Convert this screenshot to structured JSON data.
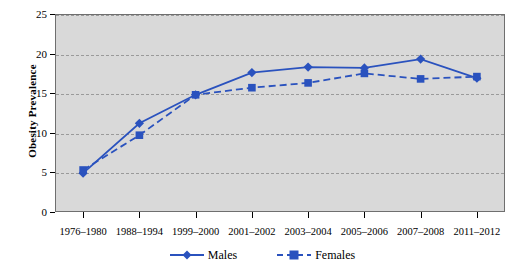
{
  "chart_data": {
    "type": "line",
    "title": "",
    "xlabel": "",
    "ylabel": "Obesity  Prevalence",
    "ylim": [
      0,
      25
    ],
    "ytick_labels": [
      "0",
      "5",
      "10",
      "15",
      "20",
      "25"
    ],
    "ytick_values": [
      0,
      5,
      10,
      15,
      20,
      25
    ],
    "grid": true,
    "legend_position": "bottom-center",
    "categories": [
      "1976–1980",
      "1988–1994",
      "1999–2000",
      "2001–2002",
      "2003–2004",
      "2005–2006",
      "2007–2008",
      "2011–2012"
    ],
    "series": [
      {
        "name": "Males",
        "color": "#2a52be",
        "line_style": "solid",
        "marker": "diamond",
        "values": [
          4.9,
          11.2,
          14.8,
          17.6,
          18.3,
          18.2,
          19.3,
          16.9
        ]
      },
      {
        "name": "Females",
        "color": "#2a52be",
        "line_style": "dashed",
        "marker": "square",
        "values": [
          5.3,
          9.7,
          14.8,
          15.7,
          16.3,
          17.5,
          16.8,
          17.1
        ]
      }
    ]
  },
  "legend": {
    "items": [
      {
        "label": "Males"
      },
      {
        "label": "Females"
      }
    ]
  },
  "colors": {
    "series": "#2a52be",
    "plot_background": "#d9d9d9",
    "gridline": "#9a9a9a",
    "axis": "#000000",
    "page_background": "#ffffff"
  }
}
